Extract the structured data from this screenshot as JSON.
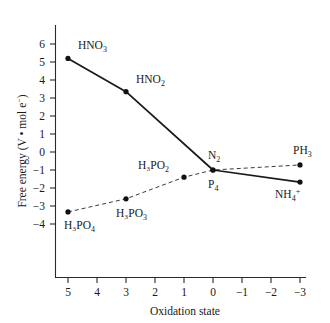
{
  "chart_data": {
    "type": "line",
    "title": "",
    "xlabel": "Oxidation state",
    "ylabel": "Free energy (V • mol e⁻)",
    "xlim": [
      5.6,
      -3.6
    ],
    "ylim": [
      -4.6,
      6.8
    ],
    "x_ticks": [
      "5",
      "4",
      "3",
      "2",
      "1",
      "0",
      "−1",
      "−2",
      "−3"
    ],
    "x_tick_values": [
      5,
      4,
      3,
      2,
      1,
      0,
      -1,
      -2,
      -3
    ],
    "y_ticks": [
      "6",
      "5",
      "4",
      "3",
      "2",
      "1",
      "0",
      "−1",
      "−2",
      "−3",
      "−4"
    ],
    "y_tick_values": [
      6,
      5,
      4,
      3,
      2,
      1,
      0,
      -1,
      -2,
      -3,
      -4
    ],
    "grid": false,
    "legend": "none",
    "x_axis_direction": "decreasing",
    "series": [
      {
        "name": "nitrogen",
        "style": "solid",
        "color": "#1a1a1a",
        "points": [
          {
            "label": "HNO3",
            "x": 5,
            "y": 6.2
          },
          {
            "label": "HNO2",
            "x": 3,
            "y": 4.35
          },
          {
            "label": "N2",
            "x": 0,
            "y": 0.0
          },
          {
            "label": "NH4+",
            "x": -3,
            "y": -0.67
          }
        ]
      },
      {
        "name": "phosphorus",
        "style": "dashed",
        "color": "#3a3a3a",
        "points": [
          {
            "label": "H3PO4",
            "x": 5,
            "y": -2.33
          },
          {
            "label": "H3PO3",
            "x": 3,
            "y": -1.6
          },
          {
            "label": "H3PO2",
            "x": 1,
            "y": -0.4
          },
          {
            "label": "P4",
            "x": 0,
            "y": 0.0
          },
          {
            "label": "PH3",
            "x": -3,
            "y": 0.28
          }
        ]
      }
    ],
    "annotations": [
      {
        "name": "hno3",
        "base": "HNO",
        "sub": "3",
        "sup": "",
        "x": 5,
        "y": 6.2,
        "dx": 10,
        "dy": -9
      },
      {
        "name": "hno2",
        "base": "HNO",
        "sub": "2",
        "sup": "",
        "x": 3,
        "y": 4.35,
        "dx": 10,
        "dy": -9
      },
      {
        "name": "n2",
        "base": "N",
        "sub": "2",
        "sup": "",
        "x": 0,
        "y": 0.0,
        "dx": -5,
        "dy": -11
      },
      {
        "name": "nh4plus",
        "base": "NH",
        "sub": "4",
        "sup": "+",
        "x": -3,
        "y": -0.67,
        "dx": -25,
        "dy": 16
      },
      {
        "name": "h3po4",
        "base": "H₃PO",
        "sub": "4",
        "sup": "",
        "x": 5,
        "y": -2.33,
        "dx": -4,
        "dy": 17
      },
      {
        "name": "h3po3",
        "base": "H₃PO",
        "sub": "3",
        "sup": "",
        "x": 3,
        "y": -1.6,
        "dx": -10,
        "dy": 18
      },
      {
        "name": "h3po2",
        "base": "H₃PO",
        "sub": "2",
        "sup": "",
        "x": 1,
        "y": -0.4,
        "dx": -46,
        "dy": -8
      },
      {
        "name": "p4",
        "base": "P",
        "sub": "4",
        "sup": "",
        "x": 0,
        "y": 0.0,
        "dx": -5,
        "dy": 18
      },
      {
        "name": "ph3",
        "base": "PH",
        "sub": "3",
        "sup": "",
        "x": -3,
        "y": 0.28,
        "dx": -7,
        "dy": -11
      }
    ]
  },
  "axes": {
    "x_title": "Oxidation state",
    "y_title_parts": {
      "pre": "Free energy (V ",
      "dot": "•",
      "mid": " mol e",
      "sup": "−",
      "post": ")"
    },
    "y_title_full": "Free energy (V • mol e⁻)"
  }
}
